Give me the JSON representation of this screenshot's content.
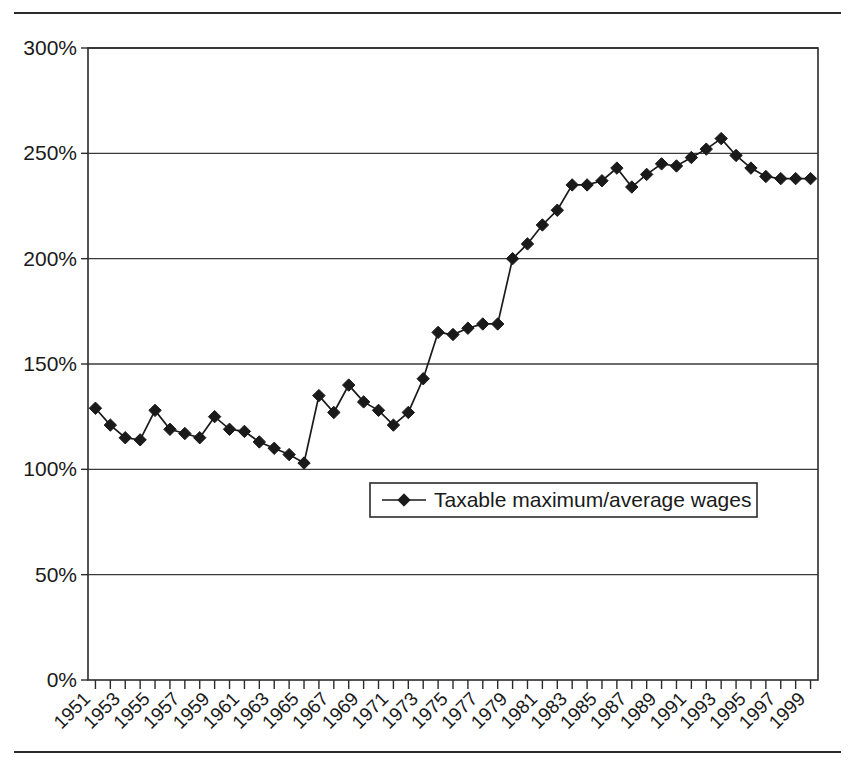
{
  "figure": {
    "background_color": "#ffffff",
    "ink_color": "#1a1a1a",
    "top_rule": "horizontal-rule",
    "bottom_rule": "horizontal-rule"
  },
  "chart_data": {
    "type": "line",
    "title": "",
    "xlabel": "",
    "ylabel": "",
    "ylim": [
      0,
      300
    ],
    "y_ticks": [
      0,
      50,
      100,
      150,
      200,
      250,
      300
    ],
    "y_tick_labels": [
      "0%",
      "50%",
      "100%",
      "150%",
      "200%",
      "250%",
      "300%"
    ],
    "grid": true,
    "grid_axis": "y",
    "legend_position": "inside-center-left",
    "legend": [
      "Taxable maximum/average wages"
    ],
    "marker": "diamond",
    "x_tick_label_rotation": -45,
    "x_tick_labels_every": 2,
    "xlim": [
      1950.5,
      1999.5
    ],
    "x": [
      1951,
      1952,
      1953,
      1954,
      1955,
      1956,
      1957,
      1958,
      1959,
      1960,
      1961,
      1962,
      1963,
      1964,
      1965,
      1966,
      1967,
      1968,
      1969,
      1970,
      1971,
      1972,
      1973,
      1974,
      1975,
      1976,
      1977,
      1978,
      1979,
      1980,
      1981,
      1982,
      1983,
      1984,
      1985,
      1986,
      1987,
      1988,
      1989,
      1990,
      1991,
      1992,
      1993,
      1994,
      1995,
      1996,
      1997,
      1998,
      1999
    ],
    "x_tick_labels": [
      "1951",
      "1953",
      "1955",
      "1957",
      "1959",
      "1961",
      "1963",
      "1965",
      "1967",
      "1969",
      "1971",
      "1973",
      "1975",
      "1977",
      "1979",
      "1981",
      "1983",
      "1985",
      "1987",
      "1989",
      "1991",
      "1993",
      "1995",
      "1997",
      "1999"
    ],
    "series": [
      {
        "name": "Taxable maximum/average wages",
        "values": [
          129,
          121,
          115,
          114,
          128,
          119,
          117,
          115,
          125,
          119,
          118,
          113,
          110,
          107,
          103,
          135,
          127,
          140,
          132,
          128,
          121,
          127,
          143,
          165,
          164,
          167,
          169,
          169,
          200,
          207,
          216,
          223,
          235,
          235,
          237,
          243,
          234,
          240,
          245,
          244,
          248,
          252,
          257,
          249,
          243,
          239,
          238,
          238,
          238
        ]
      }
    ]
  }
}
